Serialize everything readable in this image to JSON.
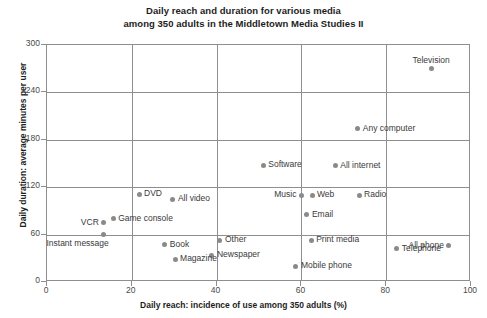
{
  "chart_data": {
    "type": "scatter",
    "title": "Daily reach and duration for various media",
    "subtitle": "among 350 adults in the Middletown Media Studies II",
    "xlabel": "Daily reach: incidence of use among 350 adults (%)",
    "ylabel": "Daily duration: average minutes per user",
    "xlim": [
      0,
      100
    ],
    "ylim": [
      0,
      300
    ],
    "xticks": [
      "0",
      "20",
      "40",
      "60",
      "80",
      "100"
    ],
    "yticks": [
      "0",
      "60",
      "120",
      "180",
      "240",
      "300"
    ],
    "grid": true,
    "legend": "none",
    "point_color": "#8a8a8a",
    "points": [
      {
        "label": "Television",
        "x": 90.6,
        "y": 270,
        "label_pos": "above"
      },
      {
        "label": "Any computer",
        "x": 73.3,
        "y": 194,
        "label_pos": "right"
      },
      {
        "label": "All internet",
        "x": 68.0,
        "y": 147,
        "label_pos": "right"
      },
      {
        "label": "Software",
        "x": 51.0,
        "y": 148,
        "label_pos": "right"
      },
      {
        "label": "Radio",
        "x": 73.6,
        "y": 110,
        "label_pos": "right"
      },
      {
        "label": "Web",
        "x": 62.5,
        "y": 110,
        "label_pos": "right"
      },
      {
        "label": "Music",
        "x": 60.0,
        "y": 110,
        "label_pos": "left"
      },
      {
        "label": "DVD",
        "x": 21.7,
        "y": 111,
        "label_pos": "right"
      },
      {
        "label": "All video",
        "x": 29.7,
        "y": 105,
        "label_pos": "right"
      },
      {
        "label": "Email",
        "x": 61.3,
        "y": 85,
        "label_pos": "right"
      },
      {
        "label": "Game console",
        "x": 15.6,
        "y": 80,
        "label_pos": "right"
      },
      {
        "label": "VCR",
        "x": 13.4,
        "y": 75,
        "label_pos": "left"
      },
      {
        "label": "Instant message",
        "x": 13.4,
        "y": 60,
        "label_pos": "below-left"
      },
      {
        "label": "Other",
        "x": 40.8,
        "y": 53,
        "label_pos": "right"
      },
      {
        "label": "Print media",
        "x": 62.3,
        "y": 53,
        "label_pos": "right"
      },
      {
        "label": "All phone",
        "x": 94.8,
        "y": 46,
        "label_pos": "left"
      },
      {
        "label": "Book",
        "x": 27.8,
        "y": 47,
        "label_pos": "right"
      },
      {
        "label": "Telephone",
        "x": 82.5,
        "y": 42,
        "label_pos": "right"
      },
      {
        "label": "Newspaper",
        "x": 38.9,
        "y": 34,
        "label_pos": "right"
      },
      {
        "label": "Magazine",
        "x": 30.2,
        "y": 29,
        "label_pos": "right"
      },
      {
        "label": "Mobile phone",
        "x": 58.7,
        "y": 20,
        "label_pos": "right"
      }
    ]
  }
}
